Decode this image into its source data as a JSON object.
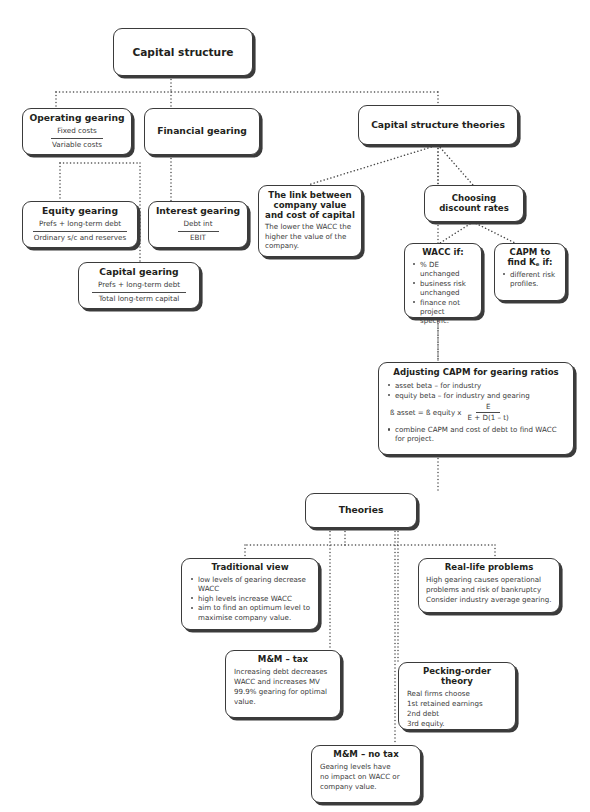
{
  "diagram": {
    "title": "Capital structure",
    "nodes": {
      "capital_structure": {
        "title": "Capital structure"
      },
      "operating_gearing": {
        "title": "Operating gearing",
        "fraction_numerator": "Fixed costs",
        "fraction_denominator": "Variable costs"
      },
      "financial_gearing": {
        "title": "Financial gearing"
      },
      "equity_gearing": {
        "title": "Equity gearing",
        "fraction_numerator": "Prefs + long-term debt",
        "fraction_denominator": "Ordinary s/c and reserves"
      },
      "interest_gearing": {
        "title": "Interest gearing",
        "fraction_numerator": "Debt int",
        "fraction_denominator": "EBIT"
      },
      "capital_gearing": {
        "title": "Capital gearing",
        "fraction_numerator": "Prefs + long-term debt",
        "fraction_denominator": "Total long-term capital"
      },
      "capital_structure_theories": {
        "title": "Capital structure theories"
      },
      "link_company_value": {
        "title": "The link between company value and cost of capital",
        "body": "The lower the WACC the higher the value of the company."
      },
      "choosing_discount_rates": {
        "title": "Choosing discount rates"
      },
      "wacc_if": {
        "title": "WACC if:",
        "bullets": [
          "% DE unchanged",
          "business risk unchanged",
          "finance not project specific."
        ]
      },
      "capm_find_ke": {
        "title": "CAPM to find K",
        "title_sub": "e",
        "title_tail": " if:",
        "bullets": [
          "different risk profiles."
        ]
      },
      "adjusting_capm": {
        "title": "Adjusting CAPM for gearing ratios",
        "bullet_1": "asset beta – for industry",
        "bullet_2": "equity beta – for industry and gearing",
        "formula_lhs": "ß asset = ß equity  x",
        "formula_numerator": "E",
        "formula_denominator": "E + D(1 – t)",
        "bullet_3": "combine CAPM and cost of debt to find WACC for project."
      },
      "theories": {
        "title": "Theories"
      },
      "traditional_view": {
        "title": "Traditional view",
        "bullets": [
          "low levels of gearing decrease WACC",
          "high levels increase WACC",
          "aim to find an optimum level to maximise company value."
        ]
      },
      "real_life_problems": {
        "title": "Real-life problems",
        "lines": [
          "High gearing causes operational",
          "problems and risk of bankruptcy",
          "Consider industry average gearing."
        ]
      },
      "mm_tax": {
        "title": "M&M – tax",
        "lines": [
          "Increasing debt decreases",
          "WACC and increases MV",
          "99.9% gearing for optimal",
          "value."
        ]
      },
      "pecking_order": {
        "title": "Pecking-order theory",
        "lines": [
          "Real firms choose",
          "1st  retained earnings",
          "2nd  debt",
          "3rd  equity."
        ]
      },
      "mm_no_tax": {
        "title": "M&M – no tax",
        "lines": [
          "Gearing levels have",
          "no impact on WACC or",
          "company value."
        ]
      }
    },
    "colors": {
      "border": "#3b3b3b",
      "shadow": "#3b3b3b",
      "text": "#231f20",
      "body_text": "#3a3a3a",
      "connector": "#4a4a4a",
      "background": "#ffffff"
    }
  }
}
